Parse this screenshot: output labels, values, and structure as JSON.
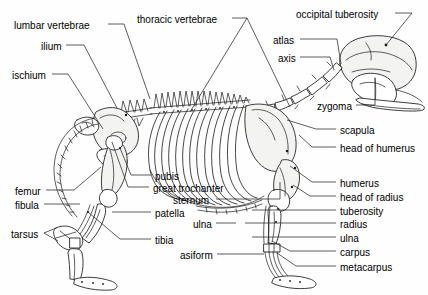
{
  "figure": {
    "orientation": "left-lateral-view",
    "background_color": "#fefefe",
    "line_color": "#1a1a1a",
    "text_color": "#000000"
  },
  "labels": [
    {
      "id": "lumbar-vertebrae",
      "text": "lumbar  vertebrae",
      "x": 14,
      "y": 20,
      "align": "left"
    },
    {
      "id": "thoracic-vertebrae",
      "text": "thoracic vertebrae",
      "x": 137,
      "y": 14,
      "align": "left"
    },
    {
      "id": "occipital-tuberosity",
      "text": "occipital tuberosity",
      "x": 296,
      "y": 9,
      "align": "left"
    },
    {
      "id": "ilium",
      "text": "ilium",
      "x": 41,
      "y": 41,
      "align": "left"
    },
    {
      "id": "atlas",
      "text": "atlas",
      "x": 273,
      "y": 35,
      "align": "left"
    },
    {
      "id": "axis",
      "text": "axis",
      "x": 278,
      "y": 53,
      "align": "left"
    },
    {
      "id": "ischium",
      "text": "ischium",
      "x": 12,
      "y": 70,
      "align": "left"
    },
    {
      "id": "zygoma",
      "text": "zygoma",
      "x": 317,
      "y": 101,
      "align": "left"
    },
    {
      "id": "scapula",
      "text": "scapula",
      "x": 340,
      "y": 125,
      "align": "left"
    },
    {
      "id": "head-of-humerus",
      "text": "head of humerus",
      "x": 340,
      "y": 143,
      "align": "left"
    },
    {
      "id": "pubis",
      "text": "pubis",
      "x": 155,
      "y": 171,
      "align": "left"
    },
    {
      "id": "great-trochanter",
      "text": "great trochanter",
      "x": 153,
      "y": 183,
      "align": "left"
    },
    {
      "id": "humerus",
      "text": "humerus",
      "x": 340,
      "y": 178,
      "align": "left"
    },
    {
      "id": "sternum",
      "text": "sternum",
      "x": 173,
      "y": 195,
      "align": "left"
    },
    {
      "id": "head-of-radius",
      "text": "head of radius",
      "x": 340,
      "y": 192,
      "align": "left"
    },
    {
      "id": "femur",
      "text": "femur",
      "x": 15,
      "y": 186,
      "align": "left"
    },
    {
      "id": "patella",
      "text": "patella",
      "x": 155,
      "y": 208,
      "align": "left"
    },
    {
      "id": "tuberosity",
      "text": "tuberosity",
      "x": 340,
      "y": 206,
      "align": "left"
    },
    {
      "id": "fibula",
      "text": "fibula",
      "x": 15,
      "y": 200,
      "align": "left"
    },
    {
      "id": "ulna-upper",
      "text": "ulna",
      "x": 193,
      "y": 219,
      "align": "left"
    },
    {
      "id": "radius",
      "text": "radius",
      "x": 340,
      "y": 219,
      "align": "left"
    },
    {
      "id": "ulna-lower",
      "text": "ulna",
      "x": 340,
      "y": 233,
      "align": "left"
    },
    {
      "id": "tarsus",
      "text": "tarsus",
      "x": 11,
      "y": 229,
      "align": "left"
    },
    {
      "id": "tibia",
      "text": "tibia",
      "x": 155,
      "y": 235,
      "align": "left"
    },
    {
      "id": "asiform",
      "text": "asiform",
      "x": 180,
      "y": 250,
      "align": "left"
    },
    {
      "id": "carpus",
      "text": "carpus",
      "x": 340,
      "y": 247,
      "align": "left"
    },
    {
      "id": "metacarpus",
      "text": "metacarpus",
      "x": 340,
      "y": 262,
      "align": "left"
    }
  ],
  "leaders": [
    {
      "id": "leader-lumbar-vertebrae",
      "d": "M 108,24 L 124,24"
    },
    {
      "id": "leader-lumbar-to-spine",
      "d": "M 124,24 L 150,99"
    },
    {
      "id": "leader-ilium",
      "d": "M 66,45 L 84,45 L 117,108"
    },
    {
      "id": "leader-ischium",
      "d": "M 52,74 L 68,74 L 103,129"
    },
    {
      "id": "leader-thoracic-left",
      "d": "M 232,18 L 247,18 L 190,112"
    },
    {
      "id": "leader-thoracic-right",
      "d": "M 247,18 L 290,107"
    },
    {
      "id": "leader-occipital",
      "d": "M 395,13 L 412,13 L 386,45"
    },
    {
      "id": "leader-atlas",
      "d": "M 300,39 L 337,39 L 341,64"
    },
    {
      "id": "leader-axis",
      "d": "M 300,57 L 330,57 L 334,70"
    },
    {
      "id": "leader-zygoma",
      "d": "M 356,105 L 375,105 L 375,78"
    },
    {
      "id": "leader-scapula",
      "d": "M 336,129 L 316,129 L 287,120"
    },
    {
      "id": "leader-head-humerus",
      "d": "M 336,147 L 312,147 L 299,135"
    },
    {
      "id": "leader-humerus",
      "d": "M 336,182 L 312,182 L 290,166"
    },
    {
      "id": "leader-head-radius",
      "d": "M 336,196 L 310,196 L 293,185"
    },
    {
      "id": "leader-tuberosity",
      "d": "M 336,210 L 252,210"
    },
    {
      "id": "leader-radius",
      "d": "M 336,223 L 245,223"
    },
    {
      "id": "leader-ulna-lower",
      "d": "M 336,237 L 252,237"
    },
    {
      "id": "leader-carpus",
      "d": "M 336,251 L 290,251 L 272,241"
    },
    {
      "id": "leader-metacarpus",
      "d": "M 336,266 L 296,266 L 277,253"
    },
    {
      "id": "leader-pubis",
      "d": "M 151,175 L 131,175 L 120,148"
    },
    {
      "id": "leader-great-trochanter",
      "d": "M 149,187 L 128,187 L 112,142"
    },
    {
      "id": "leader-sternum",
      "d": "M 216,199 L 280,199 L 280,182"
    },
    {
      "id": "leader-ulna-upper",
      "d": "M 216,223 L 236,223"
    },
    {
      "id": "leader-asiform",
      "d": "M 217,254 L 264,254"
    },
    {
      "id": "leader-femur",
      "d": "M 46,190 L 74,190 L 101,167"
    },
    {
      "id": "leader-fibula",
      "d": "M 44,204 L 80,204"
    },
    {
      "id": "leader-patella",
      "d": "M 151,212 L 112,212"
    },
    {
      "id": "leader-tibia",
      "d": "M 151,239 L 120,239 L 88,212"
    },
    {
      "id": "leader-tarsus",
      "d": "M 44,233 L 56,228"
    },
    {
      "id": "leader-tarsus2",
      "d": "M 44,233 L 58,241"
    }
  ],
  "skeleton_parts": [
    {
      "id": "skull",
      "name": "skull"
    },
    {
      "id": "mandible",
      "name": "mandible"
    },
    {
      "id": "zygomatic-arch",
      "name": "zygomatic-arch"
    },
    {
      "id": "cervical-spine",
      "name": "cervical-vertebrae"
    },
    {
      "id": "thoracic-spine",
      "name": "thoracic-vertebrae"
    },
    {
      "id": "lumbar-spine",
      "name": "lumbar-vertebrae"
    },
    {
      "id": "tail",
      "name": "caudal-vertebrae"
    },
    {
      "id": "ribcage",
      "name": "ribcage"
    },
    {
      "id": "sternum-bone",
      "name": "sternum"
    },
    {
      "id": "scapula-bone",
      "name": "scapula"
    },
    {
      "id": "humerus-bone",
      "name": "humerus"
    },
    {
      "id": "radius-bone",
      "name": "radius"
    },
    {
      "id": "ulna-bone",
      "name": "ulna"
    },
    {
      "id": "carpus-bone",
      "name": "carpus"
    },
    {
      "id": "metacarpus-bone",
      "name": "metacarpus"
    },
    {
      "id": "pelvis",
      "name": "pelvis"
    },
    {
      "id": "femur-bone",
      "name": "femur"
    },
    {
      "id": "patella-bone",
      "name": "patella"
    },
    {
      "id": "tibia-bone",
      "name": "tibia"
    },
    {
      "id": "fibula-bone",
      "name": "fibula"
    },
    {
      "id": "tarsus-bone",
      "name": "tarsus"
    },
    {
      "id": "metatarsus-bone",
      "name": "metatarsus"
    }
  ]
}
